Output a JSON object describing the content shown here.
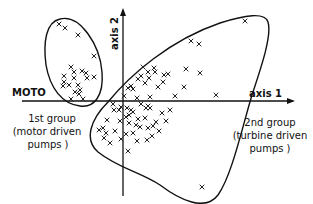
{
  "diagram": {
    "axes": {
      "horizontal_label": "axis 1",
      "vertical_label": "axis 2",
      "left_label": "MOTO"
    },
    "groups": [
      {
        "id": "group1",
        "label_line1": "1st group",
        "label_line2": "(motor driven",
        "label_line3": "pumps )",
        "points": [
          [
            59,
            24
          ],
          [
            65,
            28
          ],
          [
            78,
            35
          ],
          [
            94,
            56
          ],
          [
            71,
            67
          ],
          [
            74,
            72
          ],
          [
            82,
            71
          ],
          [
            86,
            73
          ],
          [
            64,
            76
          ],
          [
            74,
            78
          ],
          [
            87,
            78
          ],
          [
            94,
            77
          ],
          [
            64,
            82
          ],
          [
            69,
            85
          ],
          [
            78,
            85
          ],
          [
            63,
            86
          ],
          [
            80,
            90
          ],
          [
            75,
            92
          ],
          [
            79,
            94
          ],
          [
            71,
            99
          ],
          [
            83,
            99
          ]
        ]
      },
      {
        "id": "group2",
        "label_line1": "2nd group",
        "label_line2": "(turbine driven",
        "label_line3": "pumps )",
        "points": [
          [
            245,
            21
          ],
          [
            191,
            41
          ],
          [
            199,
            44
          ],
          [
            154,
            68
          ],
          [
            155,
            72
          ],
          [
            164,
            75
          ],
          [
            168,
            74
          ],
          [
            186,
            69
          ],
          [
            200,
            73
          ],
          [
            143,
            67
          ],
          [
            148,
            72
          ],
          [
            141,
            76
          ],
          [
            138,
            79
          ],
          [
            149,
            78
          ],
          [
            163,
            82
          ],
          [
            145,
            83
          ],
          [
            128,
            88
          ],
          [
            131,
            86
          ],
          [
            133,
            89
          ],
          [
            158,
            87
          ],
          [
            184,
            87
          ],
          [
            216,
            95
          ],
          [
            175,
            96
          ],
          [
            150,
            97
          ],
          [
            141,
            104
          ],
          [
            148,
            106
          ],
          [
            150,
            108
          ],
          [
            133,
            112
          ],
          [
            127,
            108
          ],
          [
            121,
            107
          ],
          [
            119,
            110
          ],
          [
            131,
            110
          ],
          [
            114,
            110
          ],
          [
            126,
            117
          ],
          [
            129,
            115
          ],
          [
            138,
            119
          ],
          [
            145,
            118
          ],
          [
            156,
            122
          ],
          [
            166,
            121
          ],
          [
            120,
            121
          ],
          [
            129,
            123
          ],
          [
            140,
            127
          ],
          [
            136,
            125
          ],
          [
            153,
            126
          ],
          [
            148,
            128
          ],
          [
            159,
            131
          ],
          [
            115,
            131
          ],
          [
            107,
            120
          ],
          [
            103,
            128
          ],
          [
            106,
            133
          ],
          [
            99,
            130
          ],
          [
            104,
            138
          ],
          [
            110,
            143
          ],
          [
            121,
            139
          ],
          [
            126,
            134
          ],
          [
            133,
            133
          ],
          [
            137,
            141
          ],
          [
            147,
            140
          ],
          [
            152,
            136
          ],
          [
            128,
            151
          ],
          [
            202,
            187
          ],
          [
            146,
            108
          ],
          [
            162,
            113
          ],
          [
            170,
            110
          ],
          [
            137,
            98
          ],
          [
            124,
            96
          ],
          [
            113,
            104
          ]
        ]
      }
    ]
  }
}
